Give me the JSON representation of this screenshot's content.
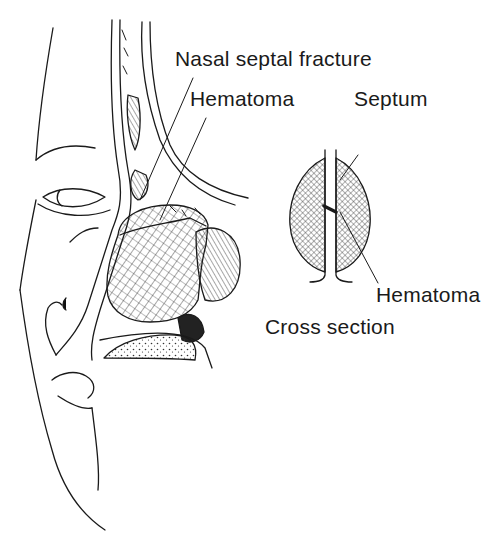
{
  "figure": {
    "labels": {
      "nasal_septal_fracture": "Nasal septal fracture",
      "hematoma_main": "Hematoma",
      "septum": "Septum",
      "hematoma_cross": "Hematoma",
      "cross_section": "Cross section"
    },
    "colors": {
      "line": "#1a1a1a",
      "background": "#ffffff"
    }
  }
}
